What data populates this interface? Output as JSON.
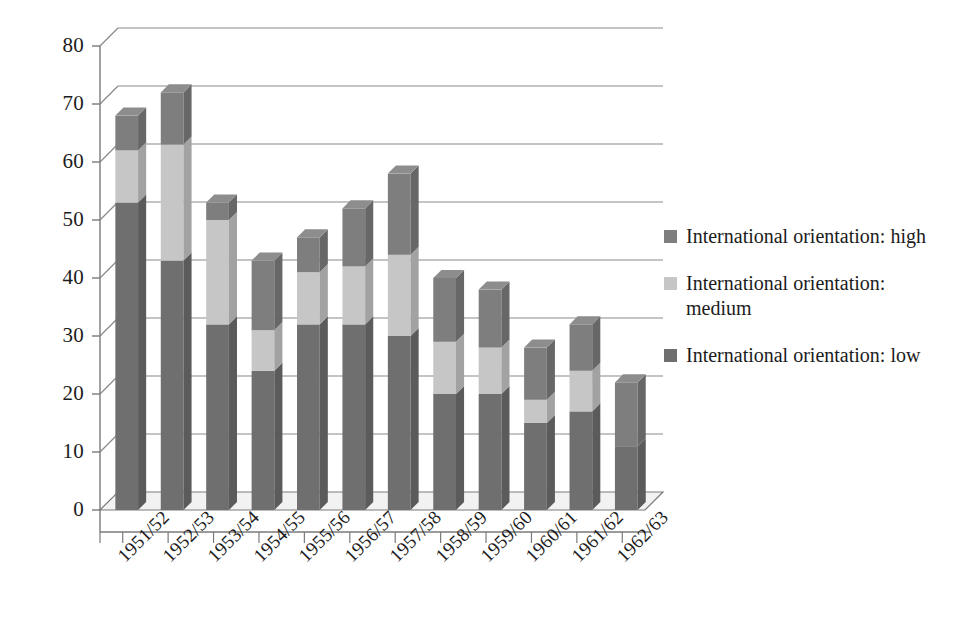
{
  "chart_data": {
    "type": "bar",
    "subtype": "stacked-3d-column",
    "title": "",
    "subtitle": "",
    "xlabel": "",
    "ylabel": "",
    "ylim": [
      0,
      80
    ],
    "y_ticks": [
      0,
      10,
      20,
      30,
      40,
      50,
      60,
      70,
      80
    ],
    "y_tick_labels": [
      "0",
      "10",
      "20",
      "30",
      "40",
      "50",
      "60",
      "70",
      "80"
    ],
    "grid": true,
    "grid_axis": "y",
    "legend_position": "right",
    "categories": [
      "1951/52",
      "1952/53",
      "1953/54",
      "1954/55",
      "1955/56",
      "1956/57",
      "1957/58",
      "1958/59",
      "1959/60",
      "1960/61",
      "1961/62",
      "1962/63"
    ],
    "stack_order_bottom_to_top": [
      "low",
      "medium",
      "high"
    ],
    "series": [
      {
        "name": "International orientation: low",
        "key": "low",
        "color": "#6f6f6f",
        "values": [
          53,
          43,
          32,
          24,
          32,
          32,
          30,
          20,
          20,
          15,
          17,
          11
        ]
      },
      {
        "name": "International orientation: medium",
        "key": "medium",
        "color": "#c6c6c6",
        "values": [
          9,
          20,
          18,
          7,
          9,
          10,
          14,
          9,
          8,
          4,
          7,
          0
        ]
      },
      {
        "name": "International orientation: high",
        "key": "high",
        "color": "#7e7e7e",
        "values": [
          6,
          9,
          3,
          12,
          6,
          10,
          14,
          11,
          10,
          9,
          8,
          11
        ]
      }
    ],
    "totals": [
      68,
      72,
      53,
      43,
      47,
      52,
      58,
      40,
      38,
      28,
      32,
      22
    ]
  },
  "legend": {
    "entries": [
      {
        "label": "International orientation: high",
        "color": "#7e7e7e"
      },
      {
        "label": "International orientation: medium",
        "color": "#c6c6c6"
      },
      {
        "label": "International orientation: low",
        "color": "#6f6f6f"
      }
    ]
  },
  "axes": {
    "y_tick_labels": [
      "80",
      "70",
      "60",
      "50",
      "40",
      "30",
      "20",
      "10",
      "0"
    ],
    "x_tick_labels": [
      "1951/52",
      "1952/53",
      "1953/54",
      "1954/55",
      "1955/56",
      "1956/57",
      "1957/58",
      "1958/59",
      "1959/60",
      "1960/61",
      "1961/62",
      "1962/63"
    ]
  },
  "style": {
    "axis_line_color": "#7a7a7a",
    "grid_line_color": "#8a8a8a",
    "floor_color": "#f2f2f2",
    "background": "#ffffff"
  }
}
